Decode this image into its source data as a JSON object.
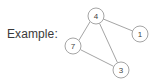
{
  "figure": {
    "caption": "Example:",
    "background_color": "#ffffff",
    "stroke_color": "#9a9a9a",
    "text_color": "#3a3a3a",
    "node_fill_color": "#ffffff",
    "node_label_color": "#3f3f3f"
  },
  "graph": {
    "type": "undirected-graph",
    "node_radius": 8,
    "nodes": [
      {
        "id": "4",
        "label": "4",
        "cx": 96,
        "cy": 16
      },
      {
        "id": "1",
        "label": "1",
        "cx": 140,
        "cy": 34
      },
      {
        "id": "7",
        "label": "7",
        "cx": 73,
        "cy": 46
      },
      {
        "id": "3",
        "label": "3",
        "cx": 121,
        "cy": 70
      }
    ],
    "edges": [
      {
        "from": "4",
        "to": "1",
        "x1": 103.3,
        "y1": 19.0,
        "x2": 132.7,
        "y2": 31.0
      },
      {
        "from": "4",
        "to": "7",
        "x1": 90.3,
        "y1": 21.3,
        "x2": 78.7,
        "y2": 40.7
      },
      {
        "from": "4",
        "to": "3",
        "x1": 99.5,
        "y1": 23.3,
        "x2": 117.5,
        "y2": 62.7
      },
      {
        "from": "7",
        "to": "3",
        "x1": 80.5,
        "y1": 49.7,
        "x2": 113.5,
        "y2": 66.3
      }
    ]
  }
}
